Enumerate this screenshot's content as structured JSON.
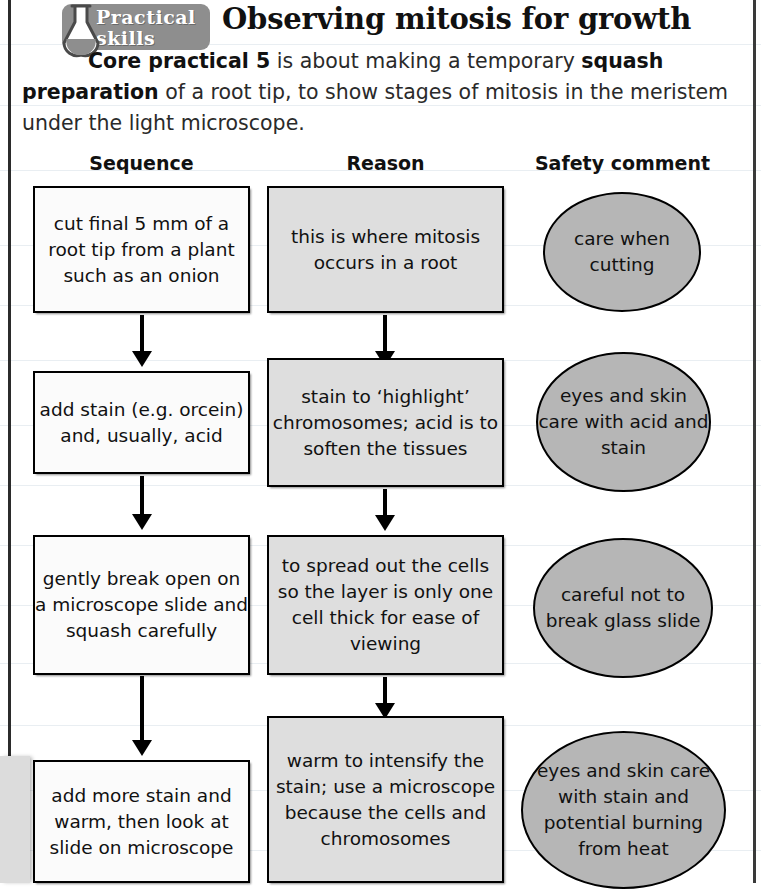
{
  "page": {
    "badge": {
      "line1": "Practical",
      "line2": "skills",
      "icon": "flask-icon",
      "bg_color": "#8e8e8e"
    },
    "title": "Observing mitosis for growth",
    "intro": {
      "bold1": "Core practical 5",
      "text1": " is about making a temporary ",
      "bold2": "squash preparation",
      "text2": " of a root tip, to show stages of mitosis in the meristem under the light microscope."
    }
  },
  "flowchart": {
    "columns": [
      {
        "key": "sequence",
        "label": "Sequence"
      },
      {
        "key": "reason",
        "label": "Reason"
      },
      {
        "key": "safety",
        "label": "Safety comment"
      }
    ],
    "colors": {
      "sequence_box_fill": "#fbfbfb",
      "reason_box_fill": "#dedede",
      "safety_oval_fill": "#b6b6b6",
      "stroke": "#000000"
    },
    "rows": [
      {
        "sequence": "cut final 5 mm of a root tip from a plant such as an onion",
        "reason": "this is where mitosis occurs in a root",
        "safety": "care when cutting"
      },
      {
        "sequence": "add stain (e.g. orcein) and, usually, acid",
        "reason": "stain to ‘highlight’ chromosomes; acid is to soften the tissues",
        "safety": "eyes and skin care with acid and stain"
      },
      {
        "sequence": "gently break open on a microscope slide and squash carefully",
        "reason": "to spread out the cells so the layer is only one cell thick for ease of viewing",
        "safety": "careful not to break glass slide"
      },
      {
        "sequence": "add more stain and warm, then look at slide on microscope",
        "reason": "warm to intensify the stain; use a microscope because the cells and chromosomes",
        "safety": "eyes and skin care with stain and potential burning from heat"
      }
    ]
  }
}
